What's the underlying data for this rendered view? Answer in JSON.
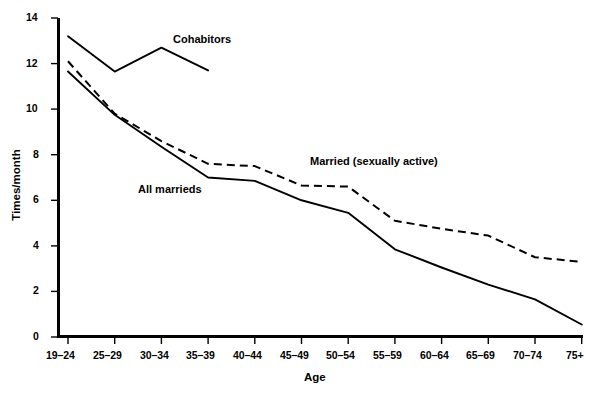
{
  "chart_data": {
    "type": "line",
    "title": "",
    "xlabel": "Age",
    "ylabel": "Times/month",
    "categories": [
      "19–24",
      "25–29",
      "30–34",
      "35–39",
      "40–44",
      "45–49",
      "50–54",
      "55–59",
      "60–64",
      "65–69",
      "70–74",
      "75+"
    ],
    "ylim": [
      0,
      14
    ],
    "yticks": [
      0,
      2,
      4,
      6,
      8,
      10,
      12,
      14
    ],
    "ytick_labels": [
      "0",
      "2",
      "4",
      "6",
      "8",
      "10",
      "12",
      "14"
    ],
    "grid": false,
    "legend_position": "inline-annotations",
    "series": [
      {
        "name": "Cohabitors",
        "style": "solid",
        "color": "#000000",
        "x": [
          "19–24",
          "25–29",
          "30–34",
          "35–39"
        ],
        "values": [
          13.2,
          11.65,
          12.7,
          11.7
        ]
      },
      {
        "name": "Married (sexually active)",
        "style": "dashed",
        "color": "#000000",
        "x": [
          "19–24",
          "25–29",
          "30–34",
          "35–39",
          "40–44",
          "45–49",
          "50–54",
          "55–59",
          "60–64",
          "65–69",
          "70–74",
          "75+"
        ],
        "values": [
          12.1,
          9.8,
          8.6,
          7.6,
          7.5,
          6.65,
          6.6,
          5.1,
          4.75,
          4.45,
          3.5,
          3.3
        ]
      },
      {
        "name": "All marrieds",
        "style": "solid",
        "color": "#000000",
        "x": [
          "19–24",
          "25–29",
          "30–34",
          "35–39",
          "40–44",
          "45–49",
          "50–54",
          "55–59",
          "60–64",
          "65–69",
          "70–74",
          "75+"
        ],
        "values": [
          11.65,
          9.75,
          8.35,
          7.0,
          6.85,
          6.0,
          5.45,
          3.85,
          3.05,
          2.3,
          1.65,
          0.55
        ]
      }
    ],
    "annotations": [
      {
        "text": "Cohabitors",
        "x_px": 173,
        "y_px": 38
      },
      {
        "text": "Married (sexually active)",
        "x_px": 310,
        "y_px": 160
      },
      {
        "text": "All marrieds",
        "x_px": 138,
        "y_px": 188
      }
    ]
  },
  "axis": {
    "x_title": "Age",
    "y_title": "Times/month"
  }
}
